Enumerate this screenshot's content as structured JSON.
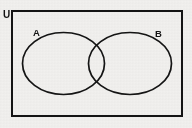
{
  "diagram": {
    "type": "venn",
    "background_color": "#f1f0ee",
    "stroke_color": "#141414",
    "universe": {
      "label": "U",
      "shape": "rectangle",
      "x": 12,
      "y": 11,
      "width": 170,
      "height": 105,
      "stroke_width": 2,
      "fill": "none",
      "label_x": 4,
      "label_y": 17
    },
    "sets": [
      {
        "label": "A",
        "shape": "ellipse",
        "cx": 63.5,
        "cy": 63.5,
        "rx": 41,
        "ry": 31,
        "stroke_width": 1.6,
        "fill": "none",
        "label_x": 33,
        "label_y": 36
      },
      {
        "label": "B",
        "shape": "ellipse",
        "cx": 130,
        "cy": 63.5,
        "rx": 41.5,
        "ry": 31,
        "stroke_width": 1.6,
        "fill": "none",
        "label_x": 155,
        "label_y": 37
      }
    ],
    "regions": [
      "A only",
      "A intersect B",
      "B only",
      "outside both (within U)"
    ]
  }
}
